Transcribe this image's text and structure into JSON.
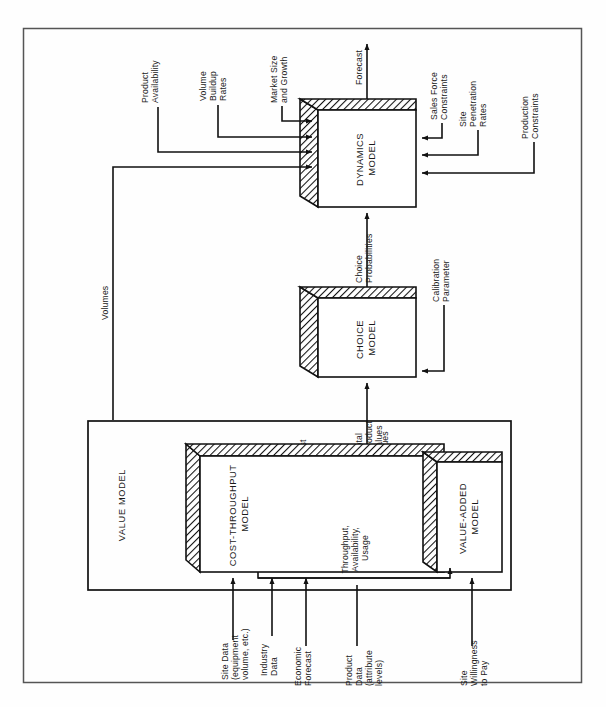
{
  "figure": {
    "orientation": "rotated-90-ccw",
    "frame": {
      "x": 23,
      "y": 28,
      "w": 559,
      "h": 655
    }
  },
  "models": {
    "dynamics": {
      "label_line1": "DYNAMICS",
      "label_line2": "MODEL"
    },
    "choice": {
      "label_line1": "CHOICE",
      "label_line2": "MODEL"
    },
    "cost_throughput": {
      "label_line1": "COST-THROUGHPUT",
      "label_line2": "MODEL"
    },
    "value_added": {
      "label_line1": "VALUE-ADDED",
      "label_line2": "MODEL"
    },
    "value_group": {
      "label": "VALUE MODEL"
    }
  },
  "flows": {
    "forecast": "Forecast",
    "choice_probabilities_l1": "Choice",
    "choice_probabilities_l2": "Probabilities",
    "total_product_values_l1": "Total",
    "total_product_values_l2": "Product",
    "total_product_values_l3": "Values",
    "volumes": "Volumes",
    "cost": "Cost",
    "values": "Values",
    "throughput_l1": "Throughput,",
    "throughput_l2": "Availability,",
    "throughput_l3": "Usage",
    "minus_operator": "–"
  },
  "dynamics_inputs_left": [
    {
      "l1": "Product",
      "l2": "Availability"
    },
    {
      "l1": "Volume",
      "l2": "Buildup",
      "l3": "Rates"
    },
    {
      "l1": "Market Size",
      "l2": "and Growth"
    }
  ],
  "dynamics_inputs_right": [
    {
      "l1": "Sales Force",
      "l2": "Constraints"
    },
    {
      "l1": "Site",
      "l2": "Penetration",
      "l3": "Rates"
    },
    {
      "l1": "Production",
      "l2": "Constraints"
    }
  ],
  "choice_inputs": [
    {
      "l1": "Calibration",
      "l2": "Parameter"
    }
  ],
  "value_inputs": [
    {
      "l1": "Site Data",
      "l2": "(equipment",
      "l3": "volume, etc.)"
    },
    {
      "l1": "Industry",
      "l2": "Data"
    },
    {
      "l1": "Economic",
      "l2": "Forecast"
    },
    {
      "l1": "Product",
      "l2": "Data",
      "l3": "(attribute",
      "l4": "levels)"
    },
    {
      "l1": "Site",
      "l2": "Willingness",
      "l3": "to Pay"
    }
  ],
  "colors": {
    "line": "#111111",
    "frame": "#555555",
    "background": "#ffffff",
    "text": "#1a1a1a"
  }
}
